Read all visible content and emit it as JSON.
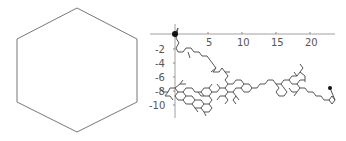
{
  "left_figure": {
    "shape": "hexagon",
    "stroke": "#777777"
  },
  "right_figure": {
    "axes": {
      "x_ticks": [
        "5",
        "10",
        "15",
        "20"
      ],
      "y_ticks": [
        "-2",
        "-4",
        "-6",
        "-8",
        "-10"
      ],
      "axis_color": "#888888"
    },
    "path_color": "#555555",
    "start_marker": "filled-circle",
    "end_marker": "filled-circle"
  }
}
